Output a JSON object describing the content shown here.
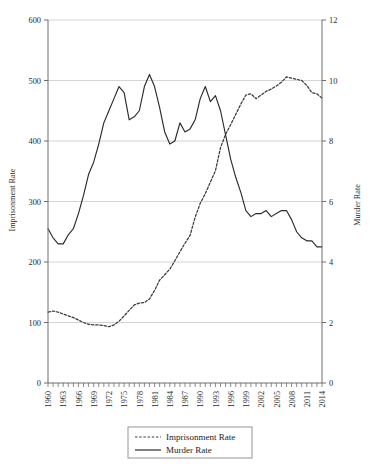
{
  "chart_data": {
    "type": "line",
    "title": "",
    "subtitle": "",
    "xlabel": "",
    "ylabel": "Imprisonment Rate",
    "y2label": "Murder Rate",
    "grid": true,
    "legend_position": "bottom",
    "xlim": [
      1960,
      2014
    ],
    "ylim": [
      0,
      600
    ],
    "y2lim": [
      0,
      12
    ],
    "yticks": [
      0,
      100,
      200,
      300,
      400,
      500,
      600
    ],
    "ytick_labels": [
      "0",
      "100",
      "200",
      "300",
      "400",
      "500",
      "600"
    ],
    "y2ticks": [
      0,
      2,
      4,
      6,
      8,
      10,
      12
    ],
    "y2tick_labels": [
      "0",
      "2",
      "4",
      "6",
      "8",
      "10",
      "12"
    ],
    "xticks": [
      1960,
      1963,
      1966,
      1969,
      1972,
      1975,
      1978,
      1981,
      1984,
      1987,
      1990,
      1993,
      1996,
      1999,
      2002,
      2005,
      2008,
      2011,
      2014
    ],
    "xtick_labels": [
      "1960",
      "1963",
      "1966",
      "1969",
      "1972",
      "1975",
      "1978",
      "1981",
      "1984",
      "1987",
      "1990",
      "1993",
      "1996",
      "1999",
      "2002",
      "2005",
      "2008",
      "2011",
      "2014"
    ],
    "x": [
      1960,
      1961,
      1962,
      1963,
      1964,
      1965,
      1966,
      1967,
      1968,
      1969,
      1970,
      1971,
      1972,
      1973,
      1974,
      1975,
      1976,
      1977,
      1978,
      1979,
      1980,
      1981,
      1982,
      1983,
      1984,
      1985,
      1986,
      1987,
      1988,
      1989,
      1990,
      1991,
      1992,
      1993,
      1994,
      1995,
      1996,
      1997,
      1998,
      1999,
      2000,
      2001,
      2002,
      2003,
      2004,
      2005,
      2006,
      2007,
      2008,
      2009,
      2010,
      2011,
      2012,
      2013,
      2014
    ],
    "series": [
      {
        "name": "Imprisonment Rate",
        "axis": "left",
        "style": "dotted",
        "color": "#3a3a3a",
        "values": [
          117,
          119,
          117,
          114,
          111,
          108,
          104,
          100,
          97,
          96,
          96,
          95,
          93,
          96,
          102,
          111,
          120,
          129,
          132,
          133,
          139,
          153,
          170,
          179,
          188,
          202,
          217,
          231,
          244,
          274,
          297,
          313,
          332,
          351,
          389,
          411,
          427,
          444,
          461,
          476,
          478,
          470,
          476,
          482,
          486,
          491,
          497,
          506,
          504,
          502,
          500,
          492,
          480,
          478,
          471
        ]
      },
      {
        "name": "Murder Rate",
        "axis": "right",
        "style": "solid",
        "color": "#2b2b2b",
        "values": [
          5.1,
          4.8,
          4.6,
          4.6,
          4.9,
          5.1,
          5.6,
          6.2,
          6.9,
          7.3,
          7.9,
          8.6,
          9.0,
          9.4,
          9.8,
          9.6,
          8.7,
          8.8,
          9.0,
          9.8,
          10.2,
          9.8,
          9.1,
          8.3,
          7.9,
          8.0,
          8.6,
          8.3,
          8.4,
          8.7,
          9.4,
          9.8,
          9.3,
          9.5,
          9.0,
          8.2,
          7.4,
          6.8,
          6.3,
          5.7,
          5.5,
          5.6,
          5.6,
          5.7,
          5.5,
          5.6,
          5.7,
          5.7,
          5.4,
          5.0,
          4.8,
          4.7,
          4.7,
          4.5,
          4.5
        ]
      }
    ],
    "legend": [
      {
        "label": "Imprisonment Rate",
        "style": "dotted"
      },
      {
        "label": "Murder Rate",
        "style": "solid"
      }
    ]
  },
  "colors": {
    "axis": "#6e6e6e",
    "grid": "#c9c9c9",
    "text": "#2b2b2b",
    "line_murder": "#2b2b2b",
    "line_imprisonment": "#3a3a3a",
    "legend_border": "#8a8a8a",
    "background": "#ffffff"
  }
}
